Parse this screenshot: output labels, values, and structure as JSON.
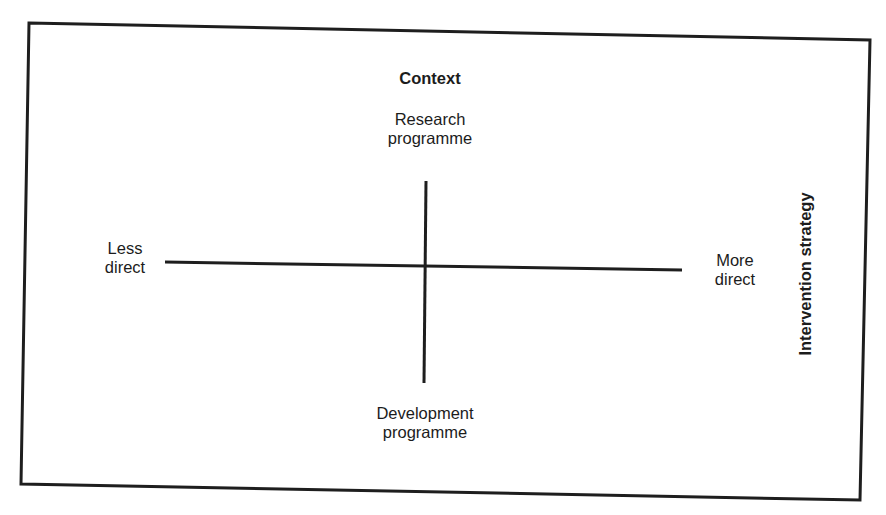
{
  "diagram": {
    "type": "quadrant",
    "vertical_axis": {
      "title": "Context",
      "top_label": "Research\nprogramme",
      "bottom_label": "Development\nprogramme"
    },
    "horizontal_axis": {
      "title": "Intervention strategy",
      "left_label": "Less\ndirect",
      "right_label": "More\ndirect"
    }
  },
  "labels": {
    "context": "Context",
    "research_line1": "Research",
    "research_line2": "programme",
    "development_line1": "Development",
    "development_line2": "programme",
    "less_line1": "Less",
    "less_line2": "direct",
    "more_line1": "More",
    "more_line2": "direct",
    "intervention": "Intervention strategy"
  },
  "colors": {
    "line": "#1e1e1e",
    "background": "#ffffff"
  }
}
